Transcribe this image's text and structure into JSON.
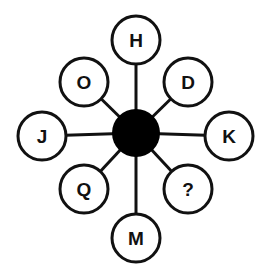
{
  "diagram": {
    "center": {
      "x": 136,
      "y": 133,
      "r": 24,
      "fill": "#000000"
    },
    "node_radius": 24,
    "stroke_color": "#111111",
    "nodes": [
      {
        "id": "top",
        "label": "H",
        "x": 136,
        "y": 40
      },
      {
        "id": "top-right",
        "label": "D",
        "x": 188,
        "y": 82
      },
      {
        "id": "right",
        "label": "K",
        "x": 229,
        "y": 136
      },
      {
        "id": "bottom-right",
        "label": "?",
        "x": 188,
        "y": 189
      },
      {
        "id": "bottom",
        "label": "M",
        "x": 136,
        "y": 238
      },
      {
        "id": "bottom-left",
        "label": "Q",
        "x": 84,
        "y": 189
      },
      {
        "id": "left",
        "label": "J",
        "x": 42,
        "y": 136
      },
      {
        "id": "top-left",
        "label": "O",
        "x": 84,
        "y": 82
      }
    ]
  }
}
